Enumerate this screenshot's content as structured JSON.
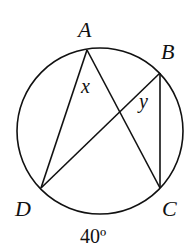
{
  "diagram": {
    "type": "circle-inscribed-angles",
    "stroke_color": "#111111",
    "circle": {
      "cx": 100,
      "cy": 131,
      "r": 83
    },
    "points": {
      "A": {
        "label": "A",
        "x": 87,
        "y": 50
      },
      "B": {
        "label": "B",
        "x": 160,
        "y": 73
      },
      "C": {
        "label": "C",
        "x": 160,
        "y": 188
      },
      "D": {
        "label": "D",
        "x": 41,
        "y": 188
      }
    },
    "segments": [
      "AD",
      "AC",
      "BD",
      "BC"
    ],
    "angle_labels": {
      "x": "x",
      "y": "y"
    },
    "arc_label": "40º"
  }
}
